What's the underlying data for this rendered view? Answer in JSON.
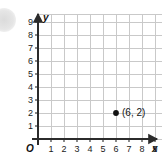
{
  "figure": {
    "origin_label": "O",
    "x_axis_name": "x",
    "y_axis_name": "y"
  },
  "chart_data": {
    "type": "scatter",
    "title": "",
    "xlabel": "x",
    "ylabel": "y",
    "xlim": [
      0,
      9.6
    ],
    "ylim": [
      0,
      9.6
    ],
    "grid": true,
    "grid_step": 1,
    "legend": "none",
    "x_ticks": [
      1,
      2,
      3,
      4,
      5,
      6,
      7,
      8,
      9
    ],
    "y_ticks": [
      1,
      2,
      3,
      4,
      5,
      6,
      7,
      8,
      9
    ],
    "x_tick_labels": [
      "1",
      "2",
      "3",
      "4",
      "5",
      "6",
      "7",
      "8",
      "9"
    ],
    "y_tick_labels": [
      "1",
      "2",
      "3",
      "4",
      "5",
      "6",
      "7",
      "8",
      "9"
    ],
    "points": [
      {
        "x": 6,
        "y": 2,
        "label": "(6, 2)",
        "marker": "filled-circle",
        "color": "#111111"
      }
    ]
  },
  "colors": {
    "grid": "#c9c9c9",
    "axis": "#2b2b2b",
    "point": "#111111",
    "text": "#1b1b1b",
    "background": "#ffffff"
  }
}
